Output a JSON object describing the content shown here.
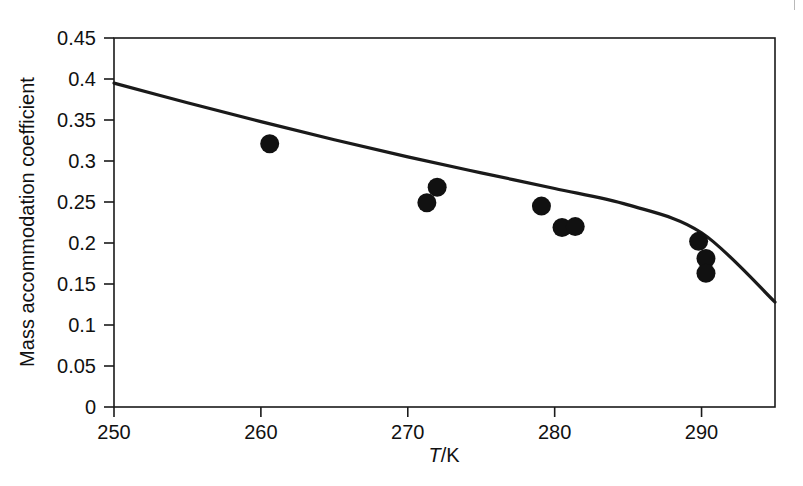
{
  "chart_data": {
    "type": "scatter",
    "title": "",
    "xlabel": "T/K",
    "ylabel": "Mass accommodation coefficient",
    "xlim": [
      250,
      295
    ],
    "ylim": [
      0,
      0.45
    ],
    "grid": false,
    "legend": "none",
    "xticks": [
      250,
      260,
      270,
      280,
      290
    ],
    "xtick_labels": [
      "250",
      "260",
      "270",
      "280",
      "290"
    ],
    "yticks": [
      0,
      0.05,
      0.1,
      0.15,
      0.2,
      0.25,
      0.3,
      0.35,
      0.4,
      0.45
    ],
    "ytick_labels": [
      "0",
      "0.05",
      "0.1",
      "0.15",
      "0.2",
      "0.25",
      "0.3",
      "0.35",
      "0.4",
      "0.45"
    ],
    "series": [
      {
        "name": "measurements",
        "marker": "filled-circle",
        "marker_color": "#111111",
        "points": [
          {
            "x": 260.6,
            "y": 0.321
          },
          {
            "x": 272.0,
            "y": 0.268
          },
          {
            "x": 271.3,
            "y": 0.249
          },
          {
            "x": 279.1,
            "y": 0.245
          },
          {
            "x": 280.5,
            "y": 0.219
          },
          {
            "x": 281.4,
            "y": 0.22
          },
          {
            "x": 289.8,
            "y": 0.202
          },
          {
            "x": 290.3,
            "y": 0.181
          },
          {
            "x": 290.3,
            "y": 0.163
          }
        ]
      },
      {
        "name": "fit-curve",
        "marker": "none",
        "line_color": "#1a1a1a",
        "points": [
          {
            "x": 250.0,
            "y": 0.395
          },
          {
            "x": 255.0,
            "y": 0.371
          },
          {
            "x": 260.0,
            "y": 0.348
          },
          {
            "x": 265.0,
            "y": 0.326
          },
          {
            "x": 270.0,
            "y": 0.305
          },
          {
            "x": 275.0,
            "y": 0.2855
          },
          {
            "x": 280.0,
            "y": 0.2665
          },
          {
            "x": 285.0,
            "y": 0.2465
          },
          {
            "x": 290.0,
            "y": 0.2125
          },
          {
            "x": 295.0,
            "y": 0.128
          }
        ]
      }
    ]
  },
  "axes": {
    "x_axis_label": "T/K",
    "x_axis_label_italic_part": "T",
    "x_axis_label_rest": "/K",
    "y_axis_label": "Mass accommodation coefficient"
  },
  "colors": {
    "ink": "#111111",
    "axis": "#1a1a1a",
    "background": "#ffffff",
    "corner_mark": "#b9b9b9"
  }
}
